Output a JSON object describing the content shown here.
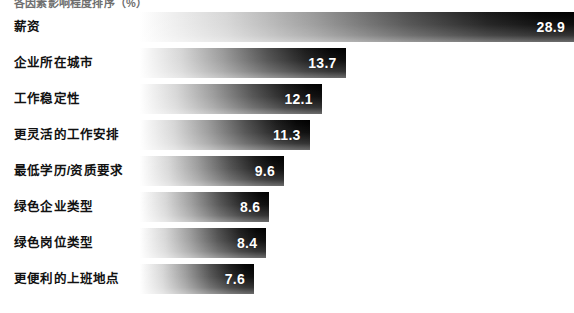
{
  "chart": {
    "title": "各因素影响程度排序（%）",
    "value_suffix": ""
  },
  "chart_data": {
    "type": "bar",
    "orientation": "horizontal",
    "title": "各因素影响程度排序（%）",
    "xlabel": "",
    "ylabel": "",
    "xlim": [
      0,
      28.9
    ],
    "grid": false,
    "legend": null,
    "categories": [
      "薪资",
      "企业所在城市",
      "工作稳定性",
      "更灵活的工作安排",
      "最低学历/资质要求",
      "绿色企业类型",
      "绿色岗位类型",
      "更便利的上班地点"
    ],
    "values": [
      28.9,
      13.7,
      12.1,
      11.3,
      9.6,
      8.6,
      8.4,
      7.6
    ],
    "value_labels": [
      "28.9",
      "13.7",
      "12.1",
      "11.3",
      "9.6",
      "8.6",
      "8.4",
      "7.6"
    ],
    "bar_style": {
      "gradient": "horizontal white-to-black",
      "start_color": "#ffffff",
      "end_color": "#000000",
      "label_color": "#ffffff"
    }
  },
  "rows": [
    {
      "label": "薪资",
      "value": "28.9",
      "pct": 100.0
    },
    {
      "label": "企业所在城市",
      "value": "13.7",
      "pct": 47.4
    },
    {
      "label": "工作稳定性",
      "value": "12.1",
      "pct": 41.9
    },
    {
      "label": "更灵活的工作安排",
      "value": "11.3",
      "pct": 39.1
    },
    {
      "label": "最低学历/资质要求",
      "value": "9.6",
      "pct": 33.2
    },
    {
      "label": "绿色企业类型",
      "value": "8.6",
      "pct": 29.8
    },
    {
      "label": "绿色岗位类型",
      "value": "8.4",
      "pct": 29.1
    },
    {
      "label": "更便利的上班地点",
      "value": "7.6",
      "pct": 26.3
    }
  ]
}
